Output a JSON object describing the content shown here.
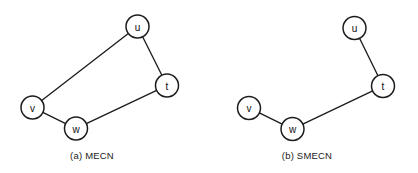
{
  "figure": {
    "background_color": "#ffffff",
    "stroke_color": "#1c1c1c",
    "label_color": "#111111",
    "width": 418,
    "height": 173
  },
  "panels": [
    {
      "id": "panel-a",
      "caption": "(a) MECN",
      "caption_x": 92,
      "caption_y": 159,
      "node_radius": 11.5,
      "nodes": [
        {
          "id": "u",
          "label": "u",
          "cx": 137.5,
          "cy": 26.5
        },
        {
          "id": "t",
          "label": "t",
          "cx": 167.0,
          "cy": 85.5
        },
        {
          "id": "v",
          "label": "v",
          "cx": 32.5,
          "cy": 107.5
        },
        {
          "id": "w",
          "label": "w",
          "cx": 76.0,
          "cy": 128.5
        }
      ],
      "edges": [
        {
          "id": "edge-v-u",
          "from": "v",
          "to": "u"
        },
        {
          "id": "edge-u-t",
          "from": "u",
          "to": "t"
        },
        {
          "id": "edge-t-w",
          "from": "t",
          "to": "w"
        },
        {
          "id": "edge-w-v",
          "from": "w",
          "to": "v"
        }
      ]
    },
    {
      "id": "panel-b",
      "caption": "(b) SMECN",
      "caption_x": 307,
      "caption_y": 159,
      "node_radius": 11.5,
      "nodes": [
        {
          "id": "u",
          "label": "u",
          "cx": 354.5,
          "cy": 28.0
        },
        {
          "id": "t",
          "label": "t",
          "cx": 383.0,
          "cy": 86.0
        },
        {
          "id": "v",
          "label": "v",
          "cx": 249.0,
          "cy": 108.0
        },
        {
          "id": "w",
          "label": "w",
          "cx": 292.5,
          "cy": 129.0
        }
      ],
      "edges": [
        {
          "id": "edge-u-t",
          "from": "u",
          "to": "t"
        },
        {
          "id": "edge-t-w",
          "from": "t",
          "to": "w"
        },
        {
          "id": "edge-w-v",
          "from": "w",
          "to": "v"
        }
      ]
    }
  ]
}
